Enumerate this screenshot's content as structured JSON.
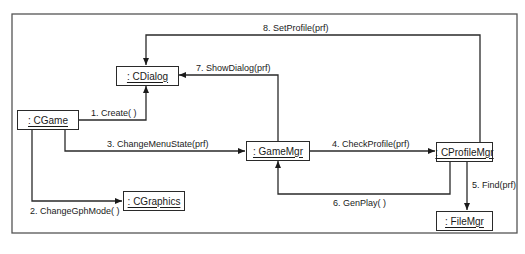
{
  "diagram": {
    "type": "UML collaboration diagram",
    "objects": [
      {
        "id": "cdialog",
        "label": ": CDialog"
      },
      {
        "id": "cgame",
        "label": ": CGame"
      },
      {
        "id": "gamemgr",
        "label": ": GameMgr"
      },
      {
        "id": "cgraphics",
        "label": ": CGraphics"
      },
      {
        "id": "cprofilemgr",
        "label": ": CProfileMgr"
      },
      {
        "id": "filemgr",
        "label": ": FileMgr"
      }
    ],
    "messages": [
      {
        "seq": 1,
        "label": "1. Create( )",
        "from": "cgame",
        "to": "cdialog"
      },
      {
        "seq": 2,
        "label": "2. ChangeGphMode( )",
        "from": "cgame",
        "to": "cgraphics"
      },
      {
        "seq": 3,
        "label": "3. ChangeMenuState(prf)",
        "from": "cgame",
        "to": "gamemgr"
      },
      {
        "seq": 4,
        "label": "4. CheckProfile(prf)",
        "from": "gamemgr",
        "to": "cprofilemgr"
      },
      {
        "seq": 5,
        "label": "5. Find(prf)",
        "from": "cprofilemgr",
        "to": "filemgr"
      },
      {
        "seq": 6,
        "label": "6. GenPlay( )",
        "from": "cprofilemgr",
        "to": "gamemgr"
      },
      {
        "seq": 7,
        "label": "7. ShowDialog(prf)",
        "from": "gamemgr",
        "to": "cdialog"
      },
      {
        "seq": 8,
        "label": "8. SetProfile(prf)",
        "from": "cprofilemgr",
        "to": "cdialog"
      }
    ],
    "colors": {
      "line": "#2a2a2a",
      "frame": "#555555",
      "background": "#ffffff"
    }
  }
}
